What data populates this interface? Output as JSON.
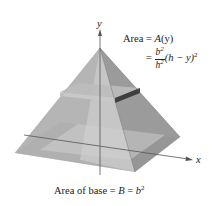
{
  "figure": {
    "axis_labels": {
      "y": "y",
      "x": "x"
    },
    "cross_section_label": {
      "line1_prefix": "Area = ",
      "line1_func": "A",
      "line1_arg": "(y)",
      "eq": "=",
      "frac_num": "b",
      "frac_num_exp": "2",
      "frac_den": "h",
      "frac_den_exp": "2",
      "tail": "(h − y)",
      "tail_exp": "2"
    },
    "base_label": {
      "prefix": "Area of base = ",
      "B": "B",
      "eq": " = ",
      "b": "b",
      "exp": "2"
    },
    "colors": {
      "left_face": "#9a9a9a",
      "front_face": "#c4c4c4",
      "right_face": "#7e7e7e",
      "base": "#d8d8d8",
      "slab_dark": "#3e3e3e",
      "axis": "#555555"
    }
  }
}
